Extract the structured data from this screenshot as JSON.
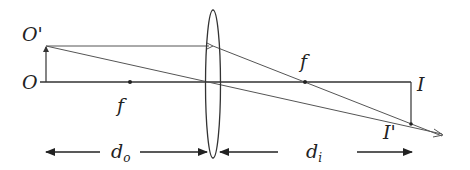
{
  "diagram": {
    "type": "thin-lens-ray-diagram",
    "labels": {
      "object_top": "O'",
      "object_base": "O",
      "focal_left": "f",
      "focal_right": "f",
      "image_base": "I",
      "image_top": "I'",
      "object_distance": "d",
      "object_distance_sub": "o",
      "image_distance": "d",
      "image_distance_sub": "i"
    },
    "colors": {
      "line": "#333333",
      "background": "#ffffff"
    }
  }
}
